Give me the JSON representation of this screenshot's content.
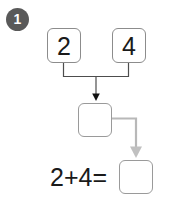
{
  "step": {
    "number": "1"
  },
  "diagram": {
    "addend_1": "2",
    "addend_2": "4",
    "middle_box_value": "",
    "answer_box_value": "",
    "equation_text": "2+4=",
    "colors": {
      "badge_background": "#595959",
      "badge_text": "#ffffff",
      "box_border": "#8c8c8c",
      "box_border_light": "#9a9a9a",
      "connector_dark": "#4d4d4d",
      "connector_light": "#b3b3b3",
      "text": "#1a1a1a",
      "page_background": "#ffffff"
    }
  }
}
